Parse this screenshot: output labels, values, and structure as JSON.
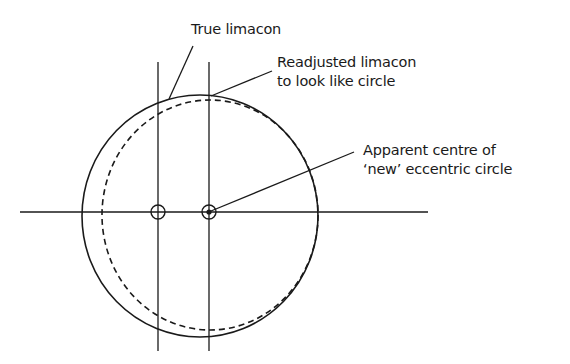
{
  "labels": {
    "true_limacon": "True limacon",
    "readjusted_line1": "Readjusted limacon",
    "readjusted_line2": "to look like circle",
    "apparent_line1": "Apparent centre of",
    "apparent_line2": "‘new’ eccentric circle"
  },
  "colors": {
    "stroke": "#1a1a1a",
    "background": "#ffffff"
  }
}
